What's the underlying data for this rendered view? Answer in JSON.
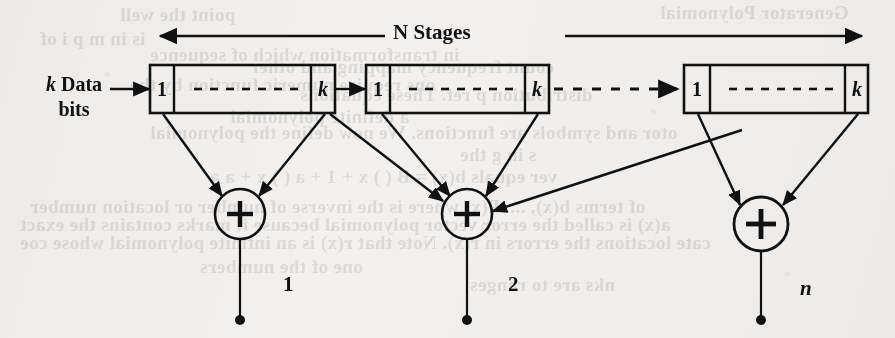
{
  "figure": {
    "title_label": "N Stages",
    "input_label_line1": "k Data",
    "input_label_line2": "bits",
    "stage_cell_first": "1",
    "stage_cell_last": "k",
    "registers": [
      {
        "name": "stage-1",
        "first_cell": "1",
        "last_cell": "k",
        "ellipsis": "- - - - - - - -"
      },
      {
        "name": "stage-2",
        "first_cell": "1",
        "last_cell": "k",
        "ellipsis": "- - - - - - - -"
      },
      {
        "name": "stage-N",
        "first_cell": "1",
        "last_cell": "k",
        "ellipsis": "- - - - - - - -"
      }
    ],
    "adders": [
      {
        "symbol": "+",
        "output_label": "1",
        "output_label_italic": false
      },
      {
        "symbol": "+",
        "output_label": "2",
        "output_label_italic": false
      },
      {
        "symbol": "+",
        "output_label": "n",
        "output_label_italic": true
      }
    ],
    "icons": {
      "arrow_right": "arrow-right-icon",
      "arrow_left": "arrow-left-icon",
      "dashed_arrow": "dashed-arrow-icon",
      "plus_circle": "plus-circle-icon",
      "terminal_dot": "terminal-dot-icon"
    },
    "colors": {
      "ink": "#111111",
      "paper": "#f2f1ef",
      "bleed": "#4a4a48"
    },
    "bleedthrough_text": [
      {
        "text": "Generator Polynomial",
        "x": 660,
        "y": 2
      },
      {
        "text": "point  the  well",
        "x": 120,
        "y": 4
      },
      {
        "text": "is  in  m  p  i  of",
        "x": 40,
        "y": 28
      },
      {
        "text": "in  transformation  which  of  sequence",
        "x": 150,
        "y": 44
      },
      {
        "text": "count  frequency  mapping  and  other",
        "x": 250,
        "y": 56
      },
      {
        "text": "ons  require  numeric  function  by  the",
        "x": 130,
        "y": 74
      },
      {
        "text": "distribution  p  ref.  These  equations",
        "x": 300,
        "y": 84
      },
      {
        "text": "a  definite  polynomial",
        "x": 230,
        "y": 106
      },
      {
        "text": "otor  and  symbols  are  functions.  We  now  define  the  polynomial",
        "x": 150,
        "y": 122
      },
      {
        "text": "s  in  g  the",
        "x": 460,
        "y": 144
      },
      {
        "text": "ver  equals  b(x)  =  B  (  )  x  +  1  +  a  (  )  x  +  a    a",
        "x": 210,
        "y": 166
      },
      {
        "text": "of  terms  b(x),  ....  P(x)  where  is  the  inverse  of  number  or  location  number",
        "x": 30,
        "y": 196
      },
      {
        "text": "a(x)  is  called  the  error  vector  polynomial  because  it  marks  contains  the  exact",
        "x": 20,
        "y": 214
      },
      {
        "text": "cate  locations  the  errors  in  r(x).   Note  that  r(x)  is  an  infinite  polynomial  whose  coe",
        "x": 20,
        "y": 232
      },
      {
        "text": "one  of  the  numbers",
        "x": 200,
        "y": 256
      },
      {
        "text": "nks  are  to  ranges",
        "x": 470,
        "y": 274
      }
    ]
  }
}
